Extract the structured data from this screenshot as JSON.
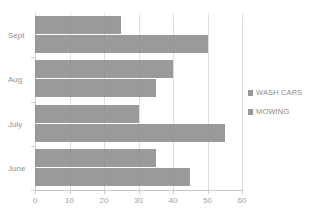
{
  "chart_data": {
    "type": "bar",
    "orientation": "horizontal",
    "title": "",
    "xlabel": "",
    "ylabel": "",
    "categories": [
      "Sept",
      "Aug",
      "July",
      "June"
    ],
    "series": [
      {
        "name": "WASH CARS",
        "values": [
          25,
          40,
          30,
          35
        ]
      },
      {
        "name": "MOWING",
        "values": [
          50,
          35,
          55,
          45
        ]
      }
    ],
    "xlim": [
      0,
      60
    ],
    "xticks": [
      0,
      10,
      20,
      30,
      40,
      50,
      60
    ],
    "xtick_labels": [
      "0",
      "10",
      "20",
      "30",
      "40",
      "50",
      "60"
    ],
    "grid": true,
    "grid_axis": "x",
    "legend_position": "right",
    "bar_color": "#8c8c8c",
    "grid_color": "#dedede",
    "axis_color": "#c9c9c9",
    "text_color": "#8f8f8f"
  },
  "legend": {
    "entries": [
      {
        "label": "WASH CARS"
      },
      {
        "label": "MOWING"
      }
    ]
  },
  "axes": {
    "x_tick_labels": [
      "0",
      "10",
      "20",
      "30",
      "40",
      "50",
      "60"
    ],
    "y_tick_labels": [
      "Sept",
      "Aug",
      "July",
      "June"
    ]
  },
  "title_strip": {
    "text": ""
  }
}
